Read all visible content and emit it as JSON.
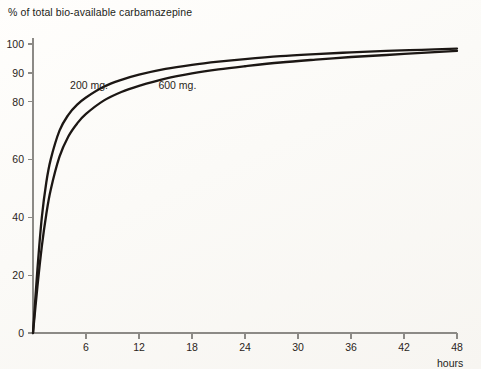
{
  "chart_data": {
    "type": "line",
    "title": "% of total bio-available carbamazepine",
    "xlabel": "hours",
    "ylabel": "",
    "x_unit": "hours",
    "xlim": [
      0,
      50
    ],
    "ylim": [
      0,
      103
    ],
    "grid": false,
    "legend_position": "inline-annotation",
    "x_ticks": [
      6,
      12,
      18,
      24,
      30,
      36,
      42,
      48
    ],
    "x_tick_labels": [
      "6",
      "12",
      "18",
      "24",
      "30",
      "36",
      "42",
      "48"
    ],
    "y_ticks": [
      0,
      20,
      40,
      60,
      80,
      90,
      100
    ],
    "y_tick_labels": [
      "0",
      "20",
      "40",
      "60",
      "80",
      "90",
      "100"
    ],
    "x": [
      0,
      0.5,
      1,
      1.5,
      2,
      3,
      4,
      5,
      6,
      8,
      10,
      12,
      15,
      18,
      21,
      24,
      28,
      32,
      36,
      40,
      44,
      48
    ],
    "series": [
      {
        "name": "200 mg.",
        "label": "200 mg.",
        "color": "#1c1714",
        "label_x": 4.2,
        "label_y": 84.5,
        "values": [
          0,
          22,
          40,
          52,
          60,
          70,
          75.5,
          79,
          81.5,
          85.2,
          87.6,
          89.4,
          91.4,
          92.8,
          93.9,
          94.8,
          95.8,
          96.5,
          97.1,
          97.6,
          98.0,
          98.4
        ]
      },
      {
        "name": "600 mg.",
        "label": "600 mg.",
        "color": "#1c1714",
        "label_x": 14.2,
        "label_y": 84.5,
        "values": [
          0,
          16,
          30,
          41,
          49.5,
          61,
          68,
          72.5,
          75.8,
          80.4,
          83.4,
          85.5,
          88.0,
          89.8,
          91.2,
          92.3,
          93.6,
          94.6,
          95.5,
          96.2,
          96.9,
          97.6
        ]
      }
    ]
  }
}
